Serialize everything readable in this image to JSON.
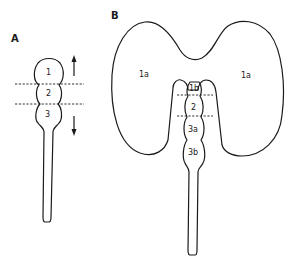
{
  "figure": {
    "panels": [
      {
        "id": "A",
        "label": "A",
        "segments": [
          "1",
          "2",
          "3"
        ],
        "arrows": [
          "up",
          "down"
        ],
        "boundaries": 2
      },
      {
        "id": "B",
        "label": "B",
        "lobe_labels": [
          "1a",
          "1a"
        ],
        "segments": [
          "1b",
          "2",
          "3a",
          "3b"
        ],
        "boundaries": 2
      }
    ],
    "colors": {
      "line": "#1a1a1a",
      "background": "#ffffff"
    }
  }
}
